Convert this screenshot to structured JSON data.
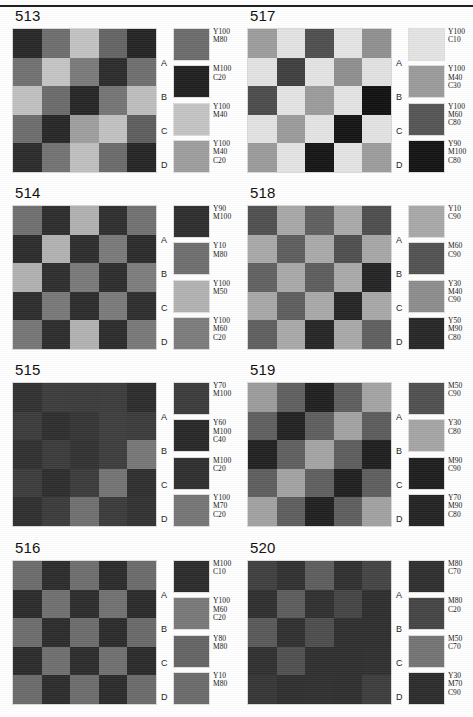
{
  "page": {
    "rule_present": true
  },
  "charts": [
    {
      "id": "513",
      "row_letters": [
        "A",
        "B",
        "C",
        "D"
      ],
      "swatches": [
        {
          "label": "Y100\nM80",
          "color": "#6b6b6b"
        },
        {
          "label": "M100\nC20",
          "color": "#1f1f1f"
        },
        {
          "label": "Y100\nM40",
          "color": "#c3c3c3"
        },
        {
          "label": "Y100\nM40\nC20",
          "color": "#9d9d9d"
        }
      ],
      "grid": [
        [
          "#272727",
          "#6d6d6d",
          "#c2c2c2",
          "#636363",
          "#232323"
        ],
        [
          "#707070",
          "#c4c4c4",
          "#7a7a7a",
          "#2b2b2b",
          "#6e6e6e"
        ],
        [
          "#c0c0c0",
          "#6a6a6a",
          "#252525",
          "#747474",
          "#bdbdbd"
        ],
        [
          "#6c6c6c",
          "#262626",
          "#9e9e9e",
          "#c1c1c1",
          "#5d5d5d"
        ],
        [
          "#2a2a2a",
          "#727272",
          "#bebebe",
          "#6a6a6a",
          "#242424"
        ]
      ]
    },
    {
      "id": "517",
      "row_letters": [
        "A",
        "B",
        "C",
        "D"
      ],
      "swatches": [
        {
          "label": "Y100\nC10",
          "color": "#e3e3e3"
        },
        {
          "label": "Y100\nM40\nC30",
          "color": "#9a9a9a"
        },
        {
          "label": "Y100\nM60\nC80",
          "color": "#545454"
        },
        {
          "label": "Y90\nM100\nC80",
          "color": "#121212"
        }
      ],
      "grid": [
        [
          "#9c9c9c",
          "#e2e2e2",
          "#4e4e4e",
          "#e4e4e4",
          "#8f8f8f"
        ],
        [
          "#e2e2e2",
          "#3e3e3e",
          "#e3e3e3",
          "#8e8e8e",
          "#e1e1e1"
        ],
        [
          "#4b4b4b",
          "#e3e3e3",
          "#9b9b9b",
          "#e3e3e3",
          "#101010"
        ],
        [
          "#e2e2e2",
          "#9a9a9a",
          "#e3e3e3",
          "#131313",
          "#e2e2e2"
        ],
        [
          "#9a9a9a",
          "#e3e3e3",
          "#141414",
          "#e3e3e3",
          "#9c9c9c"
        ]
      ]
    },
    {
      "id": "514",
      "row_letters": [
        "A",
        "B",
        "C",
        "D"
      ],
      "swatches": [
        {
          "label": "Y90\nM100",
          "color": "#2d2d2d"
        },
        {
          "label": "Y10\nM80",
          "color": "#6e6e6e"
        },
        {
          "label": "Y100\nM50",
          "color": "#b1b1b1"
        },
        {
          "label": "Y100\nM60\nC20",
          "color": "#7b7b7b"
        }
      ],
      "grid": [
        [
          "#6f6f6f",
          "#2c2c2c",
          "#b0b0b0",
          "#2e2e2e",
          "#707070"
        ],
        [
          "#2b2b2b",
          "#b1b1b1",
          "#2c2c2c",
          "#797979",
          "#2a2a2a"
        ],
        [
          "#b0b0b0",
          "#2d2d2d",
          "#797979",
          "#2c2c2c",
          "#7c7c7c"
        ],
        [
          "#2c2c2c",
          "#787878",
          "#2b2b2b",
          "#7a7a7a",
          "#2d2d2d"
        ],
        [
          "#757575",
          "#2c2c2c",
          "#b1b1b1",
          "#2b2b2b",
          "#787878"
        ]
      ]
    },
    {
      "id": "518",
      "row_letters": [
        "A",
        "B",
        "C",
        "D"
      ],
      "swatches": [
        {
          "label": "Y10\nC90",
          "color": "#a8a8a8"
        },
        {
          "label": "M60\nC90",
          "color": "#515151"
        },
        {
          "label": "Y30\nM40\nC90",
          "color": "#8c8c8c"
        },
        {
          "label": "Y50\nM90\nC80",
          "color": "#262626"
        }
      ],
      "grid": [
        [
          "#4f4f4f",
          "#a7a7a7",
          "#5e5e5e",
          "#a9a9a9",
          "#4d4d4d"
        ],
        [
          "#a8a8a8",
          "#5d5d5d",
          "#a9a9a9",
          "#4e4e4e",
          "#a6a6a6"
        ],
        [
          "#606060",
          "#a8a8a8",
          "#5c5c5c",
          "#a9a9a9",
          "#232323"
        ],
        [
          "#a7a7a7",
          "#5d5d5d",
          "#a8a8a8",
          "#242424",
          "#a7a7a7"
        ],
        [
          "#5e5e5e",
          "#a8a8a8",
          "#252525",
          "#a8a8a8",
          "#5e5e5e"
        ]
      ]
    },
    {
      "id": "515",
      "row_letters": [
        "A",
        "B",
        "C",
        "D"
      ],
      "swatches": [
        {
          "label": "Y70\nM100",
          "color": "#3a3a3a"
        },
        {
          "label": "Y60\nM100\nC40",
          "color": "#272727"
        },
        {
          "label": "M100\nC20",
          "color": "#2e2e2e"
        },
        {
          "label": "Y100\nM70\nC20",
          "color": "#757575"
        }
      ],
      "grid": [
        [
          "#303030",
          "#3b3b3b",
          "#3a3a3a",
          "#3b3b3b",
          "#2b2b2b"
        ],
        [
          "#3a3a3a",
          "#2d2d2d",
          "#343434",
          "#3d3d3d",
          "#3a3a3a"
        ],
        [
          "#2f2f2f",
          "#3a3a3a",
          "#313131",
          "#3c3c3c",
          "#767676"
        ],
        [
          "#3b3b3b",
          "#2c2c2c",
          "#3a3a3a",
          "#737373",
          "#2e2e2e"
        ],
        [
          "#2e2e2e",
          "#3a3a3a",
          "#6f6f6f",
          "#3a3a3a",
          "#313131"
        ]
      ]
    },
    {
      "id": "519",
      "row_letters": [
        "A",
        "B",
        "C",
        "D"
      ],
      "swatches": [
        {
          "label": "M50\nC90",
          "color": "#4f4f4f"
        },
        {
          "label": "Y30\nC80",
          "color": "#a4a4a4"
        },
        {
          "label": "M90\nC90",
          "color": "#1d1d1d"
        },
        {
          "label": "Y70\nM90\nC80",
          "color": "#222222"
        }
      ],
      "grid": [
        [
          "#9b9b9b",
          "#5e5e5e",
          "#1f1f1f",
          "#5d5d5d",
          "#a3a3a3"
        ],
        [
          "#5e5e5e",
          "#212121",
          "#5d5d5d",
          "#a2a2a2",
          "#5b5b5b"
        ],
        [
          "#202020",
          "#5e5e5e",
          "#a3a3a3",
          "#5c5c5c",
          "#1e1e1e"
        ],
        [
          "#5d5d5d",
          "#a2a2a2",
          "#5e5e5e",
          "#1f1f1f",
          "#5d5d5d"
        ],
        [
          "#a1a1a1",
          "#5d5d5d",
          "#1f1f1f",
          "#5d5d5d",
          "#a1a1a1"
        ]
      ]
    },
    {
      "id": "516",
      "row_letters": [
        "A",
        "B",
        "C",
        "D"
      ],
      "swatches": [
        {
          "label": "M100\nC10",
          "color": "#2a2a2a"
        },
        {
          "label": "Y100\nM60\nC20",
          "color": "#787878"
        },
        {
          "label": "Y80\nM80",
          "color": "#636363"
        },
        {
          "label": "Y10\nM80",
          "color": "#6a6a6a"
        }
      ],
      "grid": [
        [
          "#6b6b6b",
          "#2b2b2b",
          "#6d6d6d",
          "#2a2a2a",
          "#6a6a6a"
        ],
        [
          "#2a2a2a",
          "#6f6f6f",
          "#2b2b2b",
          "#707070",
          "#292929"
        ],
        [
          "#6c6c6c",
          "#2b2b2b",
          "#6b6b6b",
          "#2a2a2a",
          "#686868"
        ],
        [
          "#2a2a2a",
          "#6e6e6e",
          "#2b2b2b",
          "#6f6f6f",
          "#292929"
        ],
        [
          "#6a6a6a",
          "#2b2b2b",
          "#6c6c6c",
          "#2a2a2a",
          "#6a6a6a"
        ]
      ]
    },
    {
      "id": "520",
      "row_letters": [
        "A",
        "B",
        "C",
        "D"
      ],
      "swatches": [
        {
          "label": "M80\nC70",
          "color": "#2e2e2e"
        },
        {
          "label": "M80\nC20",
          "color": "#444444"
        },
        {
          "label": "M50\nC70",
          "color": "#737373"
        },
        {
          "label": "Y30\nM70\nC90",
          "color": "#2b2b2b"
        }
      ],
      "grid": [
        [
          "#3e3e3e",
          "#303030",
          "#5c5c5c",
          "#2f2f2f",
          "#434343"
        ],
        [
          "#2e2e2e",
          "#5b5b5b",
          "#2f2f2f",
          "#444444",
          "#2d2d2d"
        ],
        [
          "#585858",
          "#2f2f2f",
          "#4c4c4c",
          "#2e2e2e",
          "#2e2e2e"
        ],
        [
          "#2f2f2f",
          "#4f4f4f",
          "#2e2e2e",
          "#2e2e2e",
          "#2f2f2f"
        ],
        [
          "#353535",
          "#2e2e2e",
          "#2f2f2f",
          "#2e2e2e",
          "#3c3c3c"
        ]
      ]
    }
  ]
}
